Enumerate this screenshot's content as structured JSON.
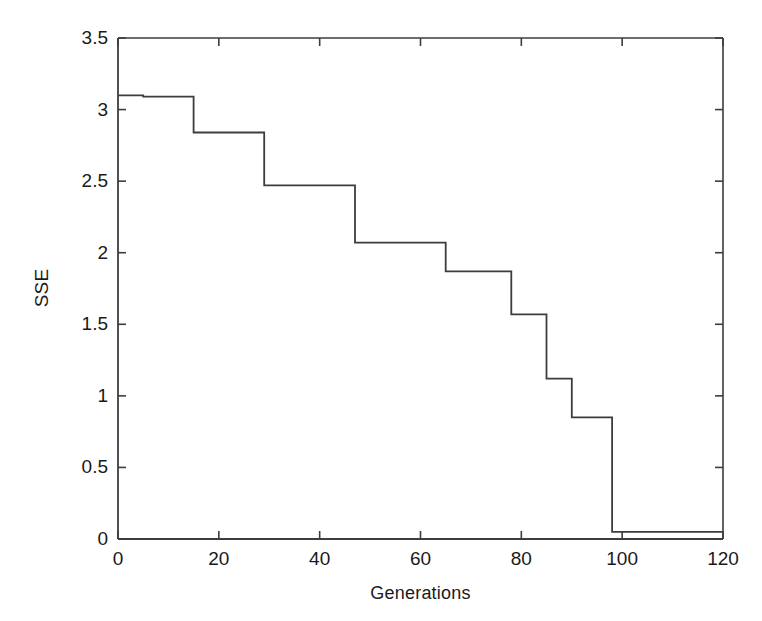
{
  "chart_data": {
    "type": "line",
    "line_style": "step-post",
    "title": "",
    "subtitle": "",
    "xlabel": "Generations",
    "ylabel": "SSE",
    "xlim": [
      0,
      120
    ],
    "ylim": [
      0,
      3.5
    ],
    "xticks": [
      0,
      20,
      40,
      60,
      80,
      100,
      120
    ],
    "yticks": [
      0,
      0.5,
      1,
      1.5,
      2,
      2.5,
      3,
      3.5
    ],
    "xticklabels": [
      "0",
      "20",
      "40",
      "60",
      "80",
      "100",
      "120"
    ],
    "yticklabels": [
      "0",
      "0.5",
      "1",
      "1.5",
      "2",
      "2.5",
      "3",
      "3.5"
    ],
    "grid": false,
    "legend": null,
    "legend_position": "none",
    "line_color": "#3d3d3d",
    "line_width": 1.8,
    "background": "#ffffff",
    "series": [
      {
        "name": "SSE",
        "x": [
          0,
          5,
          15,
          29,
          47,
          65,
          78,
          85,
          90,
          98,
          120
        ],
        "values": [
          3.1,
          3.09,
          2.84,
          2.47,
          2.07,
          1.87,
          1.57,
          1.12,
          0.85,
          0.05,
          0.05
        ]
      }
    ],
    "annotations": []
  },
  "axis": {
    "ylabel_text": "SSE",
    "xlabel_text": "Generations"
  }
}
